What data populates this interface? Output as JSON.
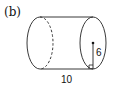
{
  "figure": {
    "label": "(b)",
    "shape": "cylinder",
    "radius_label": "6",
    "length_label": "10",
    "colors": {
      "stroke": "#222222",
      "background": "#ffffff"
    }
  }
}
